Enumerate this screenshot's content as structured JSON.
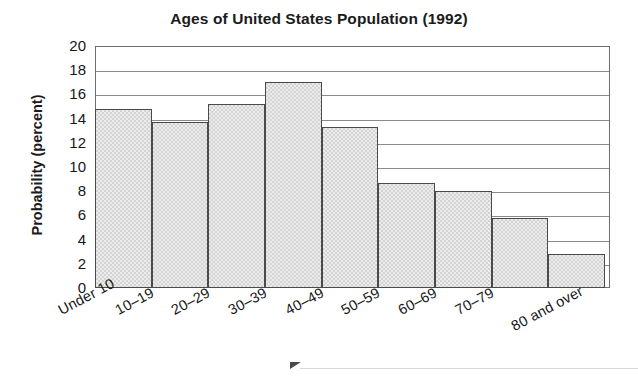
{
  "chart_data": {
    "type": "bar",
    "title": "Ages of United States Population (1992)",
    "xlabel": "",
    "ylabel": "Probability (percent)",
    "categories": [
      "Under 10",
      "10–19",
      "20–29",
      "30–39",
      "40–49",
      "50–59",
      "60–69",
      "70–79",
      "80 and over"
    ],
    "values": [
      14.8,
      13.7,
      15.2,
      17.0,
      13.3,
      8.7,
      8.0,
      5.8,
      2.8
    ],
    "ylim": [
      0,
      20
    ],
    "ytick_labels": [
      "20",
      "18",
      "16",
      "14",
      "12",
      "10",
      "8",
      "6",
      "4",
      "2",
      "0"
    ],
    "ytick_values": [
      20,
      18,
      16,
      14,
      12,
      10,
      8,
      6,
      4,
      2,
      0
    ],
    "ytick_step": 2,
    "grid": true,
    "legend": false,
    "bar_fill_color": "#d4d4d4",
    "bar_edge_color": "#4a4a4a",
    "axis_color": "#6f6f6f",
    "gridline_color": "#8a8a8a",
    "text_color": "#161616",
    "xtick_label_rotation": -28
  },
  "decorations": {
    "page_arrow": "right-triangle-marker"
  }
}
